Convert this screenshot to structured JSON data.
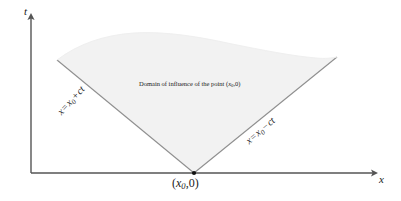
{
  "figure": {
    "kind": "domain-of-influence-diagram",
    "background_color": "#ffffff",
    "axis_color": "#555555",
    "line_color": "#8a8a8a",
    "region_fill_color": "#f2f2f2",
    "text_color": "#1a1a1a"
  },
  "axes": {
    "vertical_label": "t",
    "horizontal_label": "x",
    "origin_px": {
      "x": 31,
      "y": 173
    },
    "vertical_top_px": 14,
    "horizontal_right_px": 378
  },
  "vertex": {
    "label_full": "(x0,0)",
    "open_paren": "(",
    "var": "x",
    "subscript": "0",
    "comma": ",",
    "zero": "0",
    "close_paren": ")",
    "point_px": {
      "x": 194,
      "y": 173
    }
  },
  "characteristics": {
    "left": {
      "lhs": "x",
      "equals": "=",
      "var": "x",
      "subscript": "0",
      "operator": "+",
      "term": "ct",
      "label_full": "x = x0 + ct"
    },
    "right": {
      "lhs": "x",
      "equals": "=",
      "var": "x",
      "subscript": "0",
      "operator": "−",
      "term": "ct",
      "label_full": "x = x0 − ct"
    }
  },
  "region": {
    "caption_prefix": "Domain of influence of the point (",
    "caption_var": "x",
    "caption_sub": "0",
    "caption_suffix": ",0)",
    "caption_full": "Domain of influence of the point (x0,0)"
  }
}
